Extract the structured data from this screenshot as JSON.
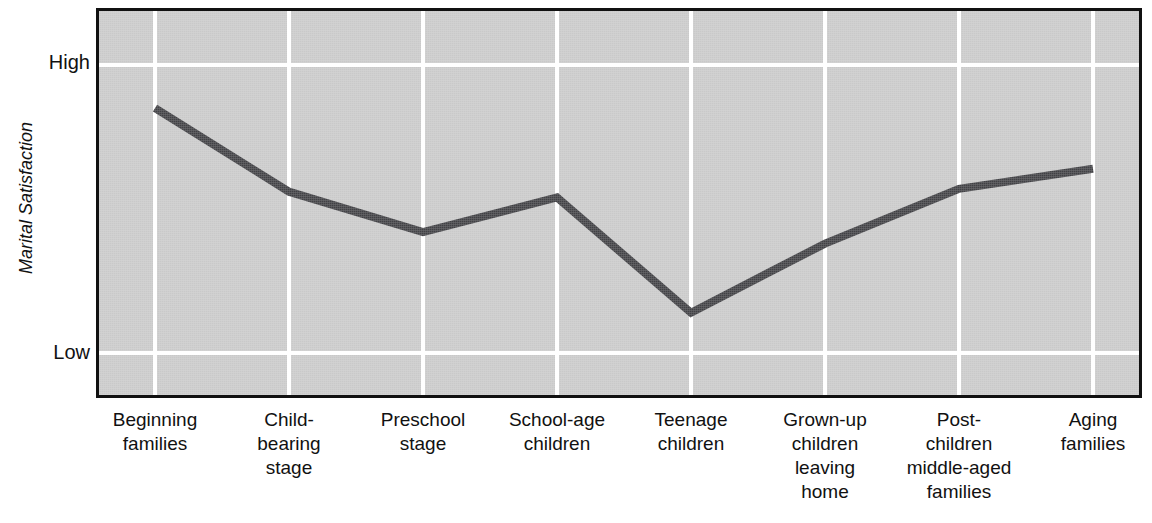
{
  "figure": {
    "y_axis_title": "Marital Satisfaction",
    "y_tick_high": "High",
    "y_tick_low": "Low"
  },
  "chart_data": {
    "type": "line",
    "title": "",
    "xlabel": "",
    "ylabel": "Marital Satisfaction",
    "categories": [
      "Beginning families",
      "Child-bearing stage",
      "Preschool stage",
      "School-age children",
      "Teenage children",
      "Grown-up children leaving home",
      "Post-children middle-aged families",
      "Aging families"
    ],
    "category_lines": [
      [
        "Beginning",
        "families"
      ],
      [
        "Child-",
        "bearing",
        "stage"
      ],
      [
        "Preschool",
        "stage"
      ],
      [
        "School-age",
        "children"
      ],
      [
        "Teenage",
        "children"
      ],
      [
        "Grown-up",
        "children",
        "leaving",
        "home"
      ],
      [
        "Post-",
        "children",
        "middle-aged",
        "families"
      ],
      [
        "Aging",
        "families"
      ]
    ],
    "values": [
      0.85,
      0.56,
      0.42,
      0.54,
      0.14,
      0.38,
      0.57,
      0.64
    ],
    "ytick_labels": [
      "Low",
      "High"
    ],
    "ytick_values": [
      0.0,
      1.0
    ],
    "ylim": [
      -0.22,
      1.2
    ],
    "grid": true,
    "legend": "none",
    "series_color": "#404044",
    "plot_background": "#c9c9c9",
    "grid_color": "#ffffff",
    "axis_color": "#111111"
  }
}
